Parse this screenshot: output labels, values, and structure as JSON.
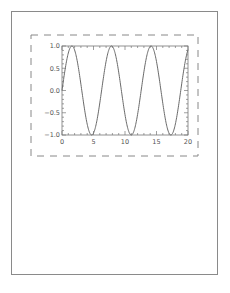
{
  "chart_data": {
    "type": "line",
    "title": "",
    "xlabel": "",
    "ylabel": "",
    "function": "y = sin(x)",
    "xlim": [
      0,
      20
    ],
    "ylim": [
      -1.0,
      1.0
    ],
    "xticks": [
      0,
      5,
      10,
      15,
      20
    ],
    "xtick_labels": [
      "0",
      "5",
      "10",
      "15",
      "20"
    ],
    "yticks": [
      -1.0,
      -0.5,
      0.0,
      0.5,
      1.0
    ],
    "ytick_labels": [
      "−1.0",
      "−0.5",
      "0.0",
      "0.5",
      "1.0"
    ],
    "x_minor_per_major": 5,
    "y_minor_per_major": 5,
    "grid": false,
    "legend": "none",
    "series": [
      {
        "name": "sin(x)",
        "x_start": 0,
        "x_end": 20,
        "samples": 401,
        "color": "#6a6a6a"
      }
    ],
    "bounding_box_style": "dashed"
  },
  "colors": {
    "axis": "#777777",
    "curve": "#6a6a6a",
    "dashed_box": "#888888",
    "page_border": "#8a8a8a"
  }
}
